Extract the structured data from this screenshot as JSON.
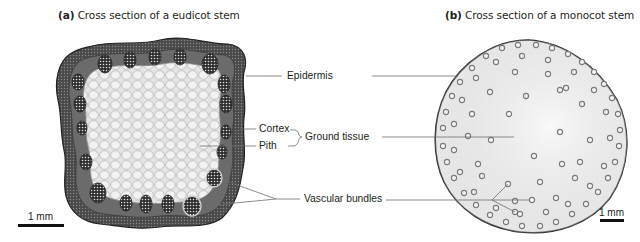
{
  "panels": [
    {
      "id": "a",
      "letter": "(a)",
      "title": "Cross section of a eudicot stem",
      "scale_bar": "1 mm"
    },
    {
      "id": "b",
      "letter": "(b)",
      "title": "Cross section of a monocot stem",
      "scale_bar": "1 mm"
    }
  ],
  "labels": {
    "epidermis": "Epidermis",
    "cortex": "Cortex",
    "pith": "Pith",
    "ground_tissue": "Ground tissue",
    "vascular_bundles": "Vascular bundles"
  },
  "colors": {
    "text": "#231f20",
    "leader_line": "#6d6e70",
    "eudicot_rim": "#3a3a3a",
    "eudicot_pith": "#e6e6e6",
    "monocot_fill": "#eeeeee",
    "bundle_ring": "#8a8a8a"
  }
}
